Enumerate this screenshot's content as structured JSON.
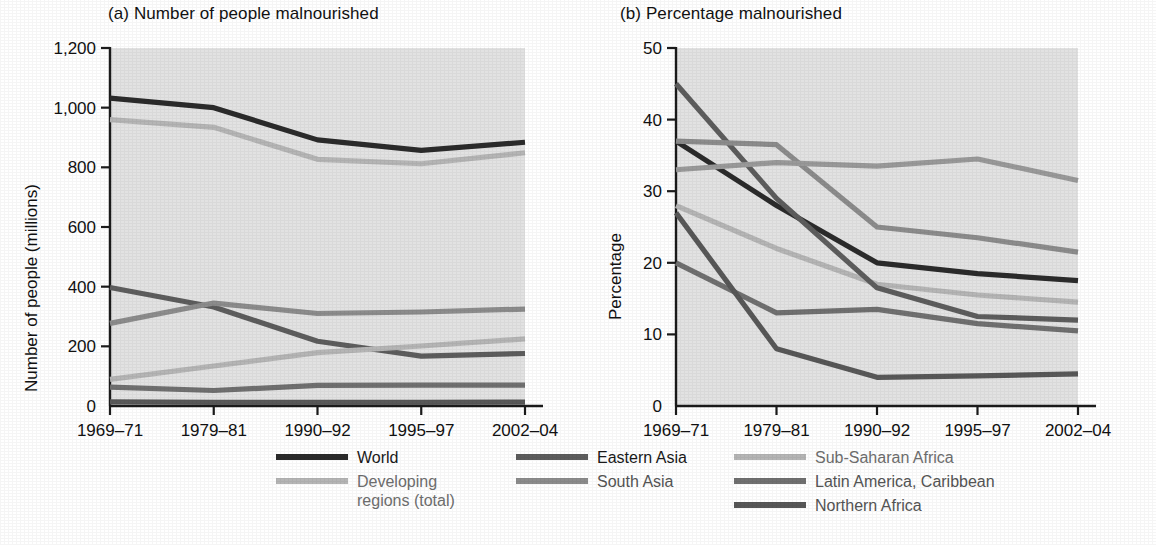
{
  "figure": {
    "background": "#ffffff",
    "plot_background": "#e2e2e2"
  },
  "panels": [
    {
      "id": "a",
      "title": "(a) Number of people malnourished",
      "ylabel": "Number of people (millions)"
    },
    {
      "id": "b",
      "title": "(b) Percentage malnourished",
      "ylabel": "Percentage"
    }
  ],
  "legend": {
    "columns": [
      {
        "items": [
          {
            "name": "World",
            "color": "#2b2b2b",
            "label_tone": "dark"
          },
          {
            "name": "Developing\nregions (total)",
            "color": "#b5b5b5",
            "label_tone": "mid"
          }
        ]
      },
      {
        "items": [
          {
            "name": "Eastern Asia",
            "color": "#5d5d5d",
            "label_tone": "dark"
          },
          {
            "name": "South Asia",
            "color": "#8c8c8c",
            "label_tone": "grey"
          }
        ]
      },
      {
        "items": [
          {
            "name": "Sub-Saharan Africa",
            "color": "#b5b5b5",
            "label_tone": "mid"
          },
          {
            "name": "Latin America, Caribbean",
            "color": "#707070",
            "label_tone": "grey"
          },
          {
            "name": "Northern Africa",
            "color": "#585858",
            "label_tone": "grey"
          }
        ]
      }
    ]
  },
  "chart_data": [
    {
      "type": "line",
      "panel": "a",
      "title": "(a) Number of people malnourished",
      "xlabel": "",
      "ylabel": "Number of people (millions)",
      "categories": [
        "1969–71",
        "1979–81",
        "1990–92",
        "1995–97",
        "2002–04"
      ],
      "ylim": [
        0,
        1200
      ],
      "yticks": [
        0,
        200,
        400,
        600,
        800,
        1000,
        1200
      ],
      "ytick_labels": [
        "0",
        "200",
        "400",
        "600",
        "800",
        "1,000",
        "1,200"
      ],
      "grid": false,
      "legend_position": "below",
      "series": [
        {
          "name": "World",
          "color": "#2b2b2b",
          "values": [
            1032,
            1000,
            892,
            857,
            884
          ]
        },
        {
          "name": "Developing regions (total)",
          "color": "#b5b5b5",
          "values": [
            960,
            934,
            827,
            812,
            849
          ]
        },
        {
          "name": "Eastern Asia",
          "color": "#5d5d5d",
          "values": [
            397,
            332,
            217,
            167,
            176
          ]
        },
        {
          "name": "South Asia",
          "color": "#8c8c8c",
          "values": [
            277,
            345,
            310,
            315,
            325
          ]
        },
        {
          "name": "Sub-Saharan Africa",
          "color": "#b5b5b5",
          "values": [
            89,
            134,
            179,
            201,
            225
          ]
        },
        {
          "name": "Latin America, Caribbean",
          "color": "#707070",
          "values": [
            63,
            52,
            69,
            70,
            70
          ]
        },
        {
          "name": "Northern Africa",
          "color": "#585858",
          "values": [
            14,
            12,
            12,
            12,
            13
          ]
        }
      ]
    },
    {
      "type": "line",
      "panel": "b",
      "title": "(b) Percentage malnourished",
      "xlabel": "",
      "ylabel": "Percentage",
      "categories": [
        "1969–71",
        "1979–81",
        "1990–92",
        "1995–97",
        "2002–04"
      ],
      "ylim": [
        0,
        50
      ],
      "yticks": [
        0,
        10,
        20,
        30,
        40,
        50
      ],
      "ytick_labels": [
        "0",
        "10",
        "20",
        "30",
        "40",
        "50"
      ],
      "grid": false,
      "legend_position": "below",
      "series": [
        {
          "name": "World",
          "color": "#2b2b2b",
          "values": [
            37,
            28,
            20,
            18.5,
            17.5
          ]
        },
        {
          "name": "Developing regions (total)",
          "color": "#b5b5b5",
          "values": [
            28,
            22,
            17,
            15.5,
            14.5
          ]
        },
        {
          "name": "Eastern Asia",
          "color": "#5d5d5d",
          "values": [
            45,
            29,
            16.5,
            12.5,
            12
          ]
        },
        {
          "name": "South Asia",
          "color": "#8c8c8c",
          "values": [
            37,
            36.5,
            25,
            23.5,
            21.5
          ]
        },
        {
          "name": "Sub-Saharan Africa",
          "color": "#999999",
          "values": [
            33,
            34,
            33.5,
            34.5,
            31.5
          ]
        },
        {
          "name": "Latin America, Caribbean",
          "color": "#707070",
          "values": [
            20,
            13,
            13.5,
            11.5,
            10.5
          ]
        },
        {
          "name": "Northern Africa",
          "color": "#585858",
          "values": [
            27,
            8,
            4,
            4.2,
            4.5
          ]
        }
      ]
    }
  ]
}
